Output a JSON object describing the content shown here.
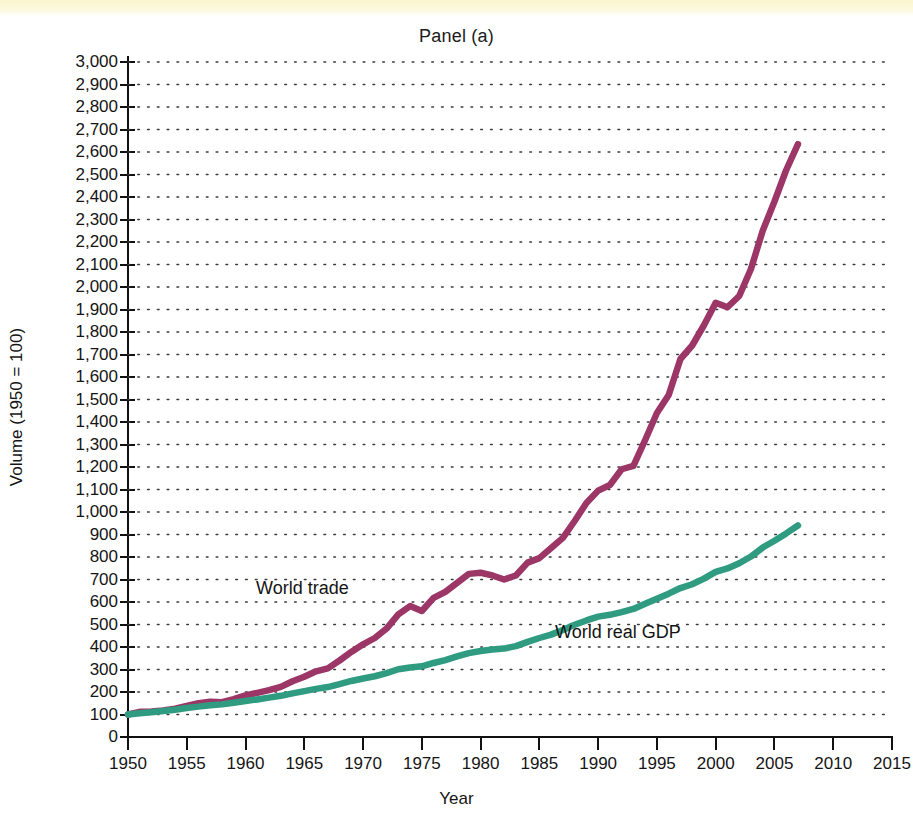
{
  "figure": {
    "title": "Panel (a)",
    "x_axis_title": "Year",
    "y_axis_title": "Volume (1950 = 100)"
  },
  "annotations": {
    "world_trade": "World trade",
    "world_real_gdp": "World real GDP"
  },
  "colors": {
    "world_trade": "#9B3666",
    "world_real_gdp": "#2F9C82",
    "axis": "#111111",
    "grid": "#3a3a3a",
    "background": "#ffffff",
    "page_tint": "#fbf6cf"
  },
  "chart_data": {
    "type": "line",
    "title": "Panel (a)",
    "subtitle": "",
    "xlabel": "Year",
    "ylabel": "Volume (1950 = 100)",
    "xlim": [
      1950,
      2015
    ],
    "ylim": [
      0,
      3000
    ],
    "grid": "horizontal-dotted",
    "legend_position": "inline-annotation",
    "x_ticks": [
      1950,
      1955,
      1960,
      1965,
      1970,
      1975,
      1980,
      1985,
      1990,
      1995,
      2000,
      2005,
      2010,
      2015
    ],
    "x_tick_labels": [
      "1950",
      "1955",
      "1960",
      "1965",
      "1970",
      "1975",
      "1980",
      "1985",
      "1990",
      "1995",
      "2000",
      "2005",
      "2010",
      "2015"
    ],
    "y_ticks": [
      0,
      100,
      200,
      300,
      400,
      500,
      600,
      700,
      800,
      900,
      1000,
      1100,
      1200,
      1300,
      1400,
      1500,
      1600,
      1700,
      1800,
      1900,
      2000,
      2100,
      2200,
      2300,
      2400,
      2500,
      2600,
      2700,
      2800,
      2900,
      3000
    ],
    "y_tick_labels": [
      "0",
      "100",
      "200",
      "300",
      "400",
      "500",
      "600",
      "700",
      "800",
      "900",
      "1,000",
      "1,100",
      "1,200",
      "1,300",
      "1,400",
      "1,500",
      "1,600",
      "1,700",
      "1,800",
      "1,900",
      "2,000",
      "2,100",
      "2,200",
      "2,300",
      "2,400",
      "2,500",
      "2,600",
      "2,700",
      "2,800",
      "2,900",
      "3,000"
    ],
    "x": [
      1950,
      1951,
      1952,
      1953,
      1954,
      1955,
      1956,
      1957,
      1958,
      1959,
      1960,
      1961,
      1962,
      1963,
      1964,
      1965,
      1966,
      1967,
      1968,
      1969,
      1970,
      1971,
      1972,
      1973,
      1974,
      1975,
      1976,
      1977,
      1978,
      1979,
      1980,
      1981,
      1982,
      1983,
      1984,
      1985,
      1986,
      1987,
      1988,
      1989,
      1990,
      1991,
      1992,
      1993,
      1994,
      1995,
      1996,
      1997,
      1998,
      1999,
      2000,
      2001,
      2002,
      2003,
      2004,
      2005,
      2006,
      2007
    ],
    "series": [
      {
        "name": "World trade",
        "color": "#9B3666",
        "values": [
          100,
          112,
          113,
          118,
          126,
          138,
          150,
          157,
          155,
          168,
          185,
          196,
          208,
          223,
          248,
          268,
          292,
          305,
          340,
          378,
          412,
          440,
          482,
          545,
          582,
          560,
          618,
          645,
          685,
          725,
          730,
          718,
          700,
          718,
          775,
          795,
          840,
          885,
          960,
          1040,
          1095,
          1120,
          1190,
          1205,
          1320,
          1440,
          1520,
          1680,
          1740,
          1830,
          1930,
          1910,
          1960,
          2080,
          2250,
          2380,
          2520,
          2635
        ]
      },
      {
        "name": "World real GDP",
        "color": "#2F9C82",
        "values": [
          100,
          106,
          110,
          116,
          121,
          129,
          135,
          141,
          145,
          152,
          160,
          167,
          175,
          183,
          194,
          204,
          214,
          222,
          235,
          249,
          260,
          270,
          284,
          301,
          309,
          314,
          329,
          342,
          358,
          373,
          382,
          389,
          393,
          404,
          423,
          440,
          455,
          476,
          499,
          518,
          535,
          543,
          555,
          569,
          592,
          614,
          637,
          662,
          679,
          704,
          734,
          749,
          772,
          802,
          842,
          872,
          905,
          940
        ]
      }
    ]
  }
}
